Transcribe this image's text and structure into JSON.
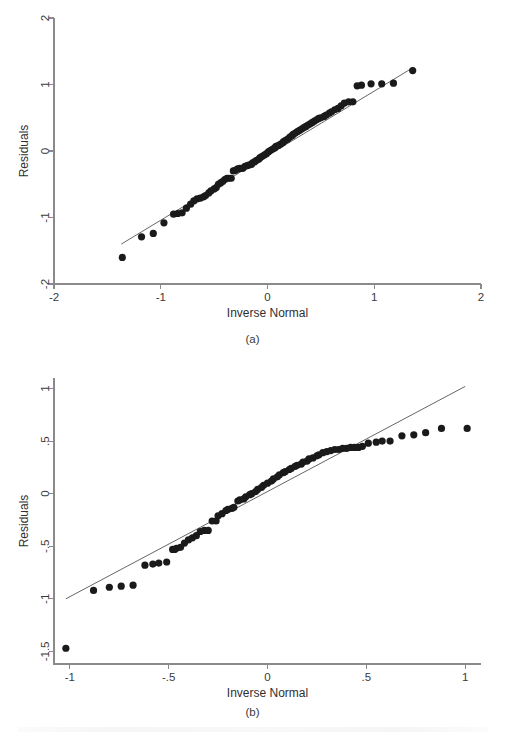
{
  "figure": {
    "background": "#ffffff",
    "point_color": "#1a1a1a",
    "axis_color": "#8a8a8a",
    "line_color": "#555555"
  },
  "panels": [
    {
      "id": "a",
      "caption": "(a)",
      "xlabel": "Inverse Normal",
      "ylabel": "Residuals"
    },
    {
      "id": "b",
      "caption": "(b)",
      "xlabel": "Inverse Normal",
      "ylabel": "Residuals"
    }
  ],
  "chart_data": [
    {
      "type": "scatter",
      "panel": "a",
      "title": "",
      "xlabel": "Inverse Normal",
      "ylabel": "Residuals",
      "xlim": [
        -2,
        2
      ],
      "ylim": [
        -2,
        2
      ],
      "xticks": [
        -2,
        -1,
        0,
        1,
        2
      ],
      "xticklabels": [
        "-2",
        "-1",
        "0",
        "1",
        "2"
      ],
      "yticks": [
        -2,
        -1,
        0,
        1,
        2
      ],
      "yticklabels": [
        "-2",
        "-1",
        "0",
        "1",
        "2"
      ],
      "grid": false,
      "legend": "none",
      "reference_line": {
        "label": "45-degree reference line",
        "x": [
          -1.37,
          1.37
        ],
        "y": [
          -1.4,
          1.26
        ]
      },
      "x": [
        -1.36,
        -1.18,
        -1.07,
        -0.97,
        -0.88,
        -0.84,
        -0.8,
        -0.76,
        -0.72,
        -0.69,
        -0.66,
        -0.63,
        -0.6,
        -0.58,
        -0.55,
        -0.53,
        -0.5,
        -0.48,
        -0.46,
        -0.44,
        -0.42,
        -0.4,
        -0.38,
        -0.36,
        -0.34,
        -0.32,
        -0.3,
        -0.28,
        -0.26,
        -0.24,
        -0.23,
        -0.21,
        -0.19,
        -0.17,
        -0.15,
        -0.14,
        -0.12,
        -0.1,
        -0.08,
        -0.07,
        -0.05,
        -0.03,
        -0.01,
        0.01,
        0.03,
        0.05,
        0.07,
        0.08,
        0.1,
        0.12,
        0.14,
        0.15,
        0.17,
        0.19,
        0.21,
        0.23,
        0.24,
        0.26,
        0.28,
        0.3,
        0.32,
        0.34,
        0.36,
        0.38,
        0.4,
        0.42,
        0.44,
        0.46,
        0.48,
        0.5,
        0.53,
        0.55,
        0.58,
        0.6,
        0.63,
        0.66,
        0.69,
        0.72,
        0.76,
        0.8,
        0.84,
        0.88,
        0.97,
        1.07,
        1.18,
        1.36
      ],
      "y": [
        -1.6,
        -1.29,
        -1.24,
        -1.08,
        -0.95,
        -0.94,
        -0.93,
        -0.86,
        -0.8,
        -0.75,
        -0.72,
        -0.71,
        -0.69,
        -0.67,
        -0.63,
        -0.6,
        -0.57,
        -0.55,
        -0.5,
        -0.48,
        -0.46,
        -0.43,
        -0.41,
        -0.41,
        -0.41,
        -0.3,
        -0.29,
        -0.27,
        -0.26,
        -0.26,
        -0.26,
        -0.23,
        -0.22,
        -0.21,
        -0.2,
        -0.18,
        -0.16,
        -0.14,
        -0.12,
        -0.1,
        -0.08,
        -0.06,
        -0.04,
        -0.01,
        0.01,
        0.03,
        0.05,
        0.07,
        0.08,
        0.1,
        0.12,
        0.14,
        0.16,
        0.18,
        0.21,
        0.23,
        0.25,
        0.27,
        0.29,
        0.31,
        0.33,
        0.35,
        0.37,
        0.39,
        0.41,
        0.43,
        0.45,
        0.47,
        0.49,
        0.5,
        0.52,
        0.54,
        0.57,
        0.59,
        0.62,
        0.64,
        0.68,
        0.72,
        0.74,
        0.74,
        0.98,
        0.99,
        1.01,
        1.01,
        1.02,
        1.21
      ]
    },
    {
      "type": "scatter",
      "panel": "b",
      "title": "",
      "xlabel": "Inverse Normal",
      "ylabel": "Residuals",
      "xlim": [
        -1.08,
        1.08
      ],
      "ylim": [
        -1.62,
        1.1
      ],
      "xticks": [
        -1,
        -0.5,
        0,
        0.5,
        1
      ],
      "xticklabels": [
        "-1",
        "-.5",
        "0",
        ".5",
        "1"
      ],
      "yticks": [
        -1.5,
        -1,
        -0.5,
        0,
        0.5,
        1
      ],
      "yticklabels": [
        "-1.5",
        "-1",
        "-.5",
        "0",
        ".5",
        "1"
      ],
      "grid": false,
      "legend": "none",
      "reference_line": {
        "label": "45-degree reference line",
        "x": [
          -1.02,
          1.0
        ],
        "y": [
          -1.0,
          1.02
        ]
      },
      "x": [
        -1.02,
        -0.88,
        -0.8,
        -0.74,
        -0.68,
        -0.62,
        -0.58,
        -0.55,
        -0.51,
        -0.48,
        -0.47,
        -0.46,
        -0.44,
        -0.42,
        -0.4,
        -0.38,
        -0.36,
        -0.34,
        -0.32,
        -0.3,
        -0.28,
        -0.26,
        -0.25,
        -0.23,
        -0.21,
        -0.2,
        -0.18,
        -0.17,
        -0.15,
        -0.14,
        -0.12,
        -0.11,
        -0.09,
        -0.08,
        -0.06,
        -0.05,
        -0.03,
        -0.02,
        0.0,
        0.02,
        0.03,
        0.05,
        0.06,
        0.08,
        0.09,
        0.11,
        0.12,
        0.14,
        0.15,
        0.17,
        0.18,
        0.2,
        0.21,
        0.23,
        0.25,
        0.26,
        0.28,
        0.3,
        0.32,
        0.34,
        0.36,
        0.38,
        0.4,
        0.42,
        0.44,
        0.46,
        0.48,
        0.51,
        0.55,
        0.58,
        0.62,
        0.68,
        0.74,
        0.8,
        0.88,
        1.01
      ],
      "y": [
        -1.47,
        -0.92,
        -0.89,
        -0.88,
        -0.87,
        -0.68,
        -0.67,
        -0.66,
        -0.65,
        -0.53,
        -0.53,
        -0.52,
        -0.51,
        -0.47,
        -0.44,
        -0.42,
        -0.4,
        -0.36,
        -0.35,
        -0.35,
        -0.26,
        -0.26,
        -0.21,
        -0.19,
        -0.16,
        -0.15,
        -0.14,
        -0.13,
        -0.07,
        -0.06,
        -0.05,
        -0.03,
        -0.01,
        0.0,
        0.02,
        0.04,
        0.06,
        0.08,
        0.1,
        0.12,
        0.14,
        0.16,
        0.18,
        0.2,
        0.21,
        0.23,
        0.24,
        0.26,
        0.27,
        0.28,
        0.3,
        0.31,
        0.33,
        0.34,
        0.36,
        0.37,
        0.39,
        0.4,
        0.41,
        0.42,
        0.42,
        0.43,
        0.43,
        0.44,
        0.44,
        0.44,
        0.45,
        0.48,
        0.49,
        0.5,
        0.5,
        0.55,
        0.56,
        0.58,
        0.62,
        0.62
      ]
    }
  ]
}
